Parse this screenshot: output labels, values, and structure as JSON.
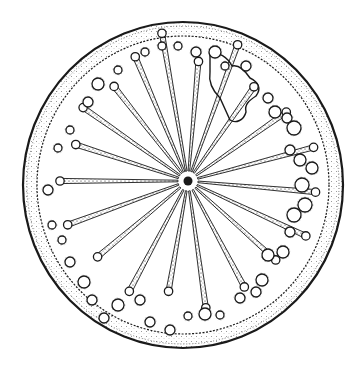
{
  "figure": {
    "background": "#ffffff",
    "ink": "#1a1a1a",
    "center": [
      188,
      181
    ],
    "outer_rim": {
      "cx": 183,
      "cy": 185,
      "rx": 160,
      "ry": 163
    },
    "inner_rim": {
      "cx": 183,
      "cy": 185,
      "rx": 146,
      "ry": 149
    },
    "rays": [
      {
        "angle": -100,
        "len": 150
      },
      {
        "angle": -85,
        "len": 120
      },
      {
        "angle": -70,
        "len": 145
      },
      {
        "angle": -55,
        "len": 115
      },
      {
        "angle": -35,
        "len": 120
      },
      {
        "angle": -15,
        "len": 130
      },
      {
        "angle": 5,
        "len": 128
      },
      {
        "angle": 25,
        "len": 130
      },
      {
        "angle": 42,
        "len": 118
      },
      {
        "angle": 62,
        "len": 120
      },
      {
        "angle": 82,
        "len": 128
      },
      {
        "angle": 100,
        "len": 112
      },
      {
        "angle": 118,
        "len": 125
      },
      {
        "angle": 140,
        "len": 118
      },
      {
        "angle": 160,
        "len": 128
      },
      {
        "angle": 180,
        "len": 128
      },
      {
        "angle": -162,
        "len": 118
      },
      {
        "angle": -145,
        "len": 128
      },
      {
        "angle": -128,
        "len": 120
      },
      {
        "angle": -113,
        "len": 135
      }
    ],
    "pores": [
      [
        145,
        52,
        4
      ],
      [
        162,
        46,
        4
      ],
      [
        178,
        46,
        4
      ],
      [
        196,
        52,
        5
      ],
      [
        215,
        52,
        6
      ],
      [
        225,
        66,
        4
      ],
      [
        98,
        84,
        6
      ],
      [
        118,
        70,
        4
      ],
      [
        88,
        102,
        5
      ],
      [
        70,
        130,
        4
      ],
      [
        58,
        148,
        4
      ],
      [
        48,
        190,
        5
      ],
      [
        52,
        225,
        4
      ],
      [
        62,
        240,
        4
      ],
      [
        70,
        262,
        5
      ],
      [
        84,
        282,
        6
      ],
      [
        92,
        300,
        5
      ],
      [
        104,
        318,
        5
      ],
      [
        118,
        305,
        6
      ],
      [
        140,
        300,
        5
      ],
      [
        150,
        322,
        5
      ],
      [
        170,
        330,
        5
      ],
      [
        188,
        316,
        4
      ],
      [
        205,
        314,
        6
      ],
      [
        220,
        315,
        4
      ],
      [
        240,
        298,
        5
      ],
      [
        256,
        292,
        5
      ],
      [
        262,
        280,
        6
      ],
      [
        268,
        255,
        6
      ],
      [
        283,
        252,
        6
      ],
      [
        290,
        232,
        5
      ],
      [
        294,
        215,
        7
      ],
      [
        305,
        205,
        7
      ],
      [
        302,
        185,
        7
      ],
      [
        312,
        168,
        6
      ],
      [
        300,
        160,
        6
      ],
      [
        290,
        150,
        5
      ],
      [
        294,
        128,
        7
      ],
      [
        287,
        118,
        5
      ],
      [
        275,
        112,
        6
      ],
      [
        268,
        98,
        5
      ],
      [
        246,
        66,
        5
      ]
    ],
    "growth_path": "M210,55 C218,50 228,58 232,66 C240,64 246,72 250,78 C258,82 262,88 256,96 C250,100 244,104 246,112 C244,120 236,124 230,120 L220,98 C214,92 208,84 210,72 Z"
  }
}
